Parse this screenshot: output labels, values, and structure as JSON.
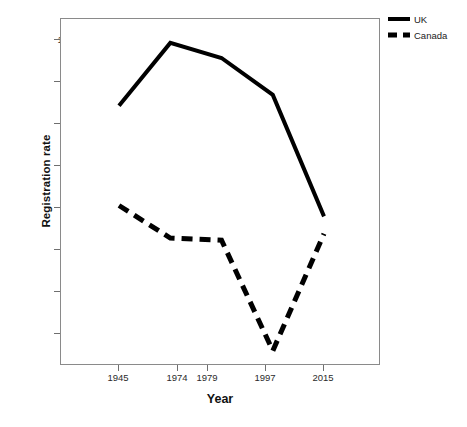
{
  "chart_data": {
    "type": "line",
    "title": "",
    "xlabel": "Year",
    "ylabel": "Registration rate",
    "categories": [
      "1945",
      "1974",
      "1979",
      "1997",
      "2015"
    ],
    "x": [
      1945,
      1974,
      1979,
      1997,
      2015
    ],
    "series": [
      {
        "name": "UK",
        "values": [
          0.966,
          0.995,
          0.988,
          0.971,
          0.915
        ],
        "style": "solid"
      },
      {
        "name": "Canada",
        "values": [
          0.92,
          0.905,
          0.904,
          0.853,
          0.907
        ],
        "style": "dashed"
      }
    ],
    "ylim": [
      0.846,
      1.006
    ],
    "yticks": [
      1.0,
      0.98,
      0.96,
      0.94,
      0.92,
      0.9,
      0.88,
      0.86
    ],
    "ytick_labels": [
      "1.00",
      ".98",
      ".96",
      ".94",
      ".92",
      ".90",
      ".88",
      ".86"
    ],
    "xtick_labels": [
      "1945",
      "1974",
      "1979",
      "1997",
      "2015"
    ],
    "grid": false,
    "legend_position": "top-right",
    "legend": [
      {
        "label": "UK",
        "style": "solid"
      },
      {
        "label": "Canada",
        "style": "dashed"
      }
    ],
    "colors": {
      "line": "#000000",
      "frame": "#8a8a8a",
      "tick_text": "#2b2b2b"
    }
  }
}
